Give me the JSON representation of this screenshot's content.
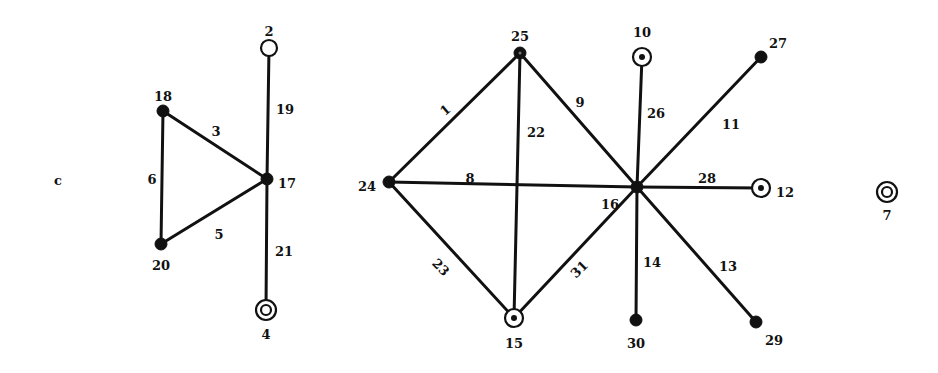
{
  "figure": {
    "panel_label": "c",
    "width": 938,
    "height": 373
  },
  "nodes": [
    {
      "id": "2",
      "x": 269,
      "y": 48,
      "style": "open",
      "label_dx": 0,
      "label_dy": -16
    },
    {
      "id": "18",
      "x": 163,
      "y": 111,
      "style": "filled",
      "label_dx": 0,
      "label_dy": -14
    },
    {
      "id": "17",
      "x": 267,
      "y": 179,
      "style": "filled",
      "label_dx": 20,
      "label_dy": 5
    },
    {
      "id": "20",
      "x": 161,
      "y": 244,
      "style": "filled",
      "label_dx": 0,
      "label_dy": 22
    },
    {
      "id": "4",
      "x": 266,
      "y": 310,
      "style": "double",
      "label_dx": 0,
      "label_dy": 25
    },
    {
      "id": "25",
      "x": 520,
      "y": 53,
      "style": "filled-dot",
      "label_dx": 0,
      "label_dy": -16
    },
    {
      "id": "24",
      "x": 389,
      "y": 182,
      "style": "filled",
      "label_dx": -22,
      "label_dy": 5
    },
    {
      "id": "15",
      "x": 514,
      "y": 318,
      "style": "target",
      "label_dx": 0,
      "label_dy": 26
    },
    {
      "id": "16",
      "x": 637,
      "y": 187,
      "style": "filled",
      "label_dx": -27,
      "label_dy": 18
    },
    {
      "id": "10",
      "x": 642,
      "y": 57,
      "style": "target",
      "label_dx": 0,
      "label_dy": -24
    },
    {
      "id": "27",
      "x": 761,
      "y": 57,
      "style": "filled",
      "label_dx": 17,
      "label_dy": -13
    },
    {
      "id": "12",
      "x": 761,
      "y": 188,
      "style": "target",
      "label_dx": 24,
      "label_dy": 5
    },
    {
      "id": "30",
      "x": 636,
      "y": 320,
      "style": "filled",
      "label_dx": 0,
      "label_dy": 24
    },
    {
      "id": "29",
      "x": 756,
      "y": 322,
      "style": "filled",
      "label_dx": 18,
      "label_dy": 19
    },
    {
      "id": "7",
      "x": 887,
      "y": 192,
      "style": "double",
      "label_dx": 0,
      "label_dy": 24
    }
  ],
  "edges": [
    {
      "id": "19",
      "from": "2",
      "to": "17",
      "lx": 285,
      "ly": 110,
      "rot": 0
    },
    {
      "id": "3",
      "from": "18",
      "to": "17",
      "lx": 216,
      "ly": 132,
      "rot": 0
    },
    {
      "id": "6",
      "from": "18",
      "to": "20",
      "lx": 152,
      "ly": 180,
      "rot": 0
    },
    {
      "id": "5",
      "from": "20",
      "to": "17",
      "lx": 219,
      "ly": 235,
      "rot": 0
    },
    {
      "id": "21",
      "from": "17",
      "to": "4",
      "lx": 284,
      "ly": 252,
      "rot": 0
    },
    {
      "id": "1",
      "from": "24",
      "to": "25",
      "lx": 446,
      "ly": 111,
      "rot": -40
    },
    {
      "id": "22",
      "from": "25",
      "to": "15",
      "lx": 536,
      "ly": 133,
      "rot": 0
    },
    {
      "id": "9",
      "from": "25",
      "to": "16",
      "lx": 580,
      "ly": 103,
      "rot": 0
    },
    {
      "id": "8",
      "from": "24",
      "to": "16",
      "lx": 470,
      "ly": 179,
      "rot": 0
    },
    {
      "id": "23",
      "from": "24",
      "to": "15",
      "lx": 440,
      "ly": 268,
      "rot": 45
    },
    {
      "id": "31",
      "from": "15",
      "to": "16",
      "lx": 580,
      "ly": 270,
      "rot": -45
    },
    {
      "id": "26",
      "from": "10",
      "to": "16",
      "lx": 656,
      "ly": 114,
      "rot": 0
    },
    {
      "id": "11",
      "from": "16",
      "to": "27",
      "lx": 731,
      "ly": 125,
      "rot": 0
    },
    {
      "id": "28",
      "from": "16",
      "to": "12",
      "lx": 707,
      "ly": 179,
      "rot": 0
    },
    {
      "id": "14",
      "from": "16",
      "to": "30",
      "lx": 652,
      "ly": 263,
      "rot": 0
    },
    {
      "id": "13",
      "from": "16",
      "to": "29",
      "lx": 728,
      "ly": 267,
      "rot": 0
    }
  ],
  "colors": {
    "ink": "#111111",
    "background": "#ffffff"
  }
}
